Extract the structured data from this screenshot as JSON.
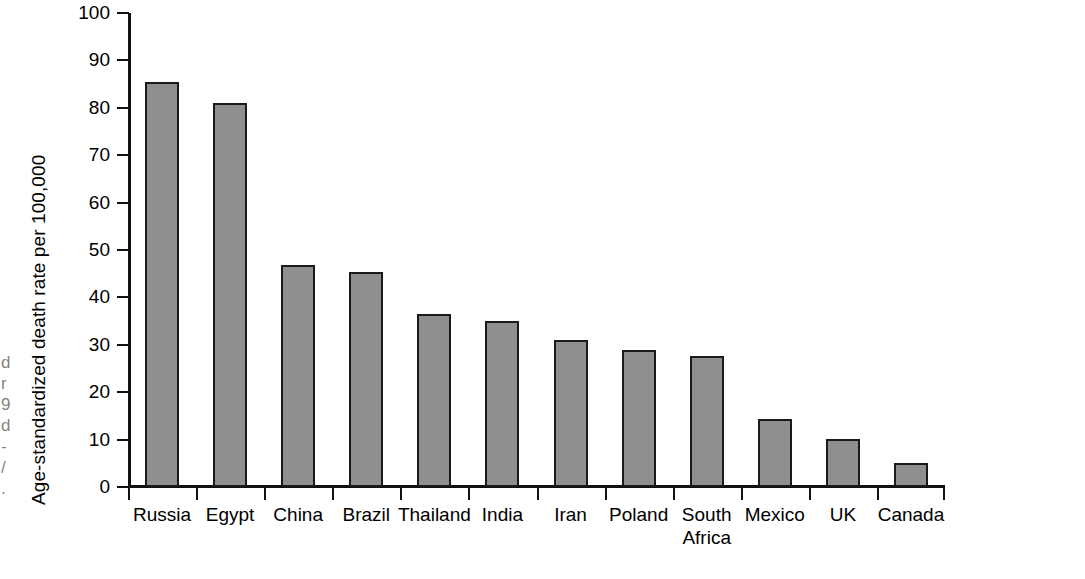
{
  "chart_data": {
    "type": "bar",
    "title": "",
    "subtitle": "",
    "xlabel": "",
    "ylabel": "Age-standardized death rate per 100,000",
    "categories": [
      "Russia",
      "Egypt",
      "China",
      "Brazil",
      "Thailand",
      "India",
      "Iran",
      "Poland",
      "South\nAfrica",
      "Mexico",
      "UK",
      "Canada"
    ],
    "values": [
      85.4,
      81.0,
      46.8,
      45.4,
      36.4,
      35.1,
      31.1,
      28.9,
      27.7,
      14.3,
      10.2,
      5.0
    ],
    "ylim": [
      0,
      100
    ],
    "ytick_labels": [
      "100",
      "90",
      "80",
      "70",
      "60",
      "50",
      "40",
      "30",
      "20",
      "10",
      "0"
    ],
    "ytick_values": [
      100,
      90,
      80,
      70,
      60,
      50,
      40,
      30,
      20,
      10,
      0
    ],
    "grid": false,
    "legend": false,
    "legend_position": "none",
    "bar_fill_color": "#8f8f8f",
    "bar_edge_color": "#1a1a1a",
    "axis_color": "#111111",
    "background_color": "#ffffff"
  },
  "artifact": {
    "edge_text": "d\nr\n9\nd\n-\n/\n."
  }
}
